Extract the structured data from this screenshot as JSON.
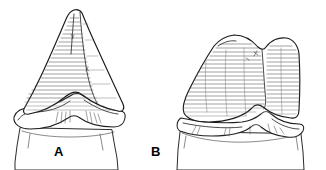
{
  "figure": {
    "background_color": "#ffffff",
    "ink_color": "#1a1a1a",
    "hatch_color": "#4a4a4a",
    "width": 326,
    "height": 170,
    "style": "line-drawing"
  },
  "panels": [
    {
      "id": "A",
      "label": "A",
      "label_x": 54,
      "label_y": 145,
      "name": "tall-pointed-cusp-tooth",
      "cusp_count": 1,
      "apex_x": 78,
      "apex_y": 10,
      "crown_left_x": 24,
      "crown_right_x": 122,
      "cervical_band_y": 118,
      "has_root_fragment": true
    },
    {
      "id": "B",
      "label": "B",
      "label_x": 151,
      "label_y": 145,
      "name": "broad-bicuspid-crown-tooth",
      "cusp_count": 2,
      "main_cusp_x": 232,
      "main_cusp_y": 36,
      "minor_cusp_x": 283,
      "minor_cusp_y": 40,
      "notch_x": 263,
      "notch_y": 48,
      "crown_left_x": 185,
      "crown_right_x": 300,
      "cervical_band_y": 125,
      "has_root_fragment": true
    }
  ]
}
